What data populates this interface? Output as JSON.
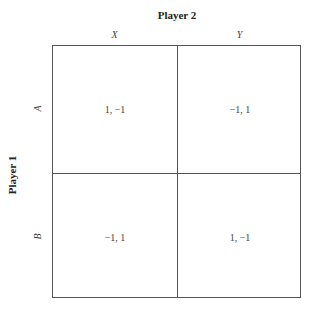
{
  "player2": {
    "title": "Player 2",
    "strategies": [
      "X",
      "Y"
    ]
  },
  "player1": {
    "title": "Player 1",
    "strategies": [
      "A",
      "B"
    ]
  },
  "payoffs": [
    [
      "1, −1",
      "−1, 1"
    ],
    [
      "−1, 1",
      "1, −1"
    ]
  ]
}
